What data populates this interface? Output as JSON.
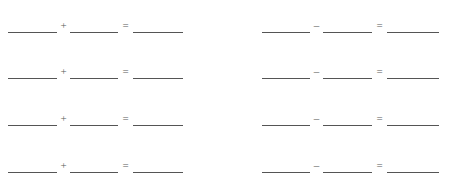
{
  "page": {
    "background_color": "#ffffff",
    "rule_color": "#555555",
    "symbol_color": "#5a5a5a",
    "columns": 2,
    "rows": 4
  },
  "worksheet": {
    "columns": [
      {
        "name": "addition-column",
        "operator": "+",
        "equals": "=",
        "problems": [
          {
            "operand_a": "",
            "operand_b": "",
            "result": ""
          },
          {
            "operand_a": "",
            "operand_b": "",
            "result": ""
          },
          {
            "operand_a": "",
            "operand_b": "",
            "result": ""
          },
          {
            "operand_a": "",
            "operand_b": "",
            "result": ""
          }
        ]
      },
      {
        "name": "subtraction-column",
        "operator": "–",
        "equals": "=",
        "problems": [
          {
            "operand_a": "",
            "operand_b": "",
            "result": ""
          },
          {
            "operand_a": "",
            "operand_b": "",
            "result": ""
          },
          {
            "operand_a": "",
            "operand_b": "",
            "result": ""
          },
          {
            "operand_a": "",
            "operand_b": "",
            "result": ""
          }
        ]
      }
    ]
  }
}
